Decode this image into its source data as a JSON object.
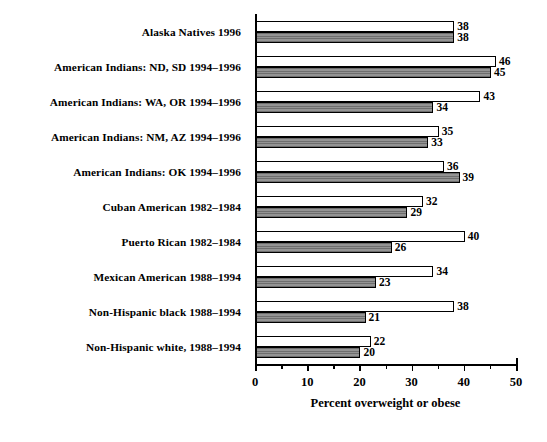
{
  "chart_data": {
    "type": "bar",
    "orientation": "horizontal",
    "title": "",
    "xlabel": "Percent overweight or obese",
    "ylabel": "",
    "xlim": [
      0,
      50
    ],
    "xticks": [
      0,
      10,
      20,
      30,
      40,
      50
    ],
    "xtick_labels": [
      "0",
      "10",
      "20",
      "30",
      "40",
      "50"
    ],
    "minor_tick_interval": 5,
    "grid": false,
    "legend": false,
    "categories": [
      "Alaska Natives 1996",
      "American Indians: ND, SD 1994–1996",
      "American Indians: WA, OR 1994–1996",
      "American Indians: NM, AZ 1994–1996",
      "American Indians: OK 1994–1996",
      "Cuban American 1982–1984",
      "Puerto Rican 1982–1984",
      "Mexican American 1988–1994",
      "Non-Hispanic black 1988–1994",
      "Non-Hispanic white, 1988–1994"
    ],
    "series": [
      {
        "name": "white-bar",
        "fill": "white",
        "values": [
          38,
          46,
          43,
          35,
          36,
          32,
          40,
          34,
          38,
          22
        ]
      },
      {
        "name": "gray-bar",
        "fill": "gray-striped",
        "values": [
          38,
          45,
          34,
          33,
          39,
          29,
          26,
          23,
          21,
          20
        ]
      }
    ],
    "colors": {
      "white_bar": "#ffffff",
      "gray_bar": "#8a8a8a",
      "gray_bar_stripe": "#6e6e6e",
      "outline": "#000000",
      "text": "#000000",
      "background": "#ffffff"
    }
  }
}
